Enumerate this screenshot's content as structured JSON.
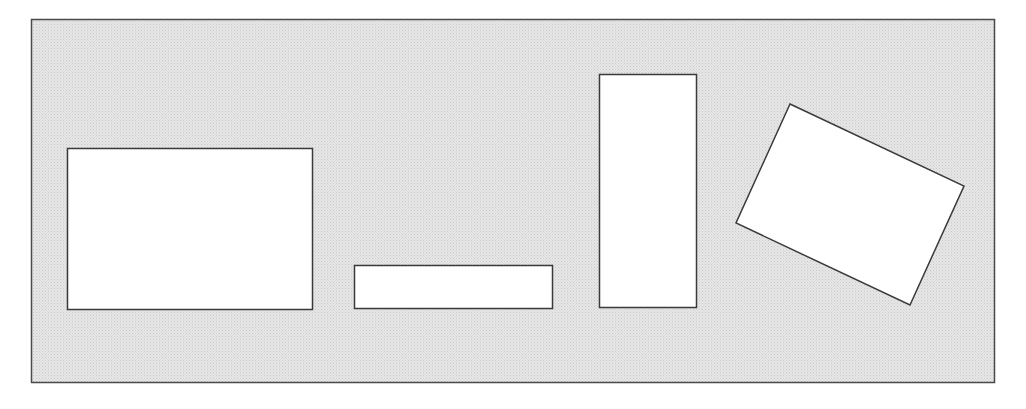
{
  "diagram": {
    "colors": {
      "page_background": "#ffffff",
      "panel_fill": "#e6e6e6",
      "panel_dots": "#c8c8c8",
      "panel_stroke": "#4a4a4a",
      "shape_fill": "#ffffff",
      "shape_stroke": "#3a3a3a"
    },
    "shapes": [
      {
        "id": "wide-rectangle",
        "kind": "rectangle",
        "orientation": "landscape",
        "rotation_deg": 0
      },
      {
        "id": "thin-rectangle",
        "kind": "rectangle",
        "orientation": "landscape-elongated",
        "rotation_deg": 0
      },
      {
        "id": "tall-rectangle",
        "kind": "rectangle",
        "orientation": "portrait",
        "rotation_deg": 0
      },
      {
        "id": "rotated-rectangle",
        "kind": "rectangle",
        "orientation": "landscape",
        "rotation_deg": 25
      }
    ]
  }
}
